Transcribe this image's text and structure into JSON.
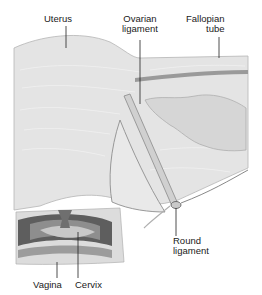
{
  "diagram": {
    "type": "anatomical-illustration",
    "colors": {
      "tissue_light": "#e4e4e4",
      "tissue_mid": "#d2d2d2",
      "tissue_dark": "#8c8c8c",
      "tissue_darkest": "#5a5a5a",
      "outline": "#9a9a9a",
      "leader_line": "#222222",
      "background": "#ffffff"
    },
    "labels": {
      "uterus": "Uterus",
      "ovarian_ligament_line1": "Ovarian",
      "ovarian_ligament_line2": "ligament",
      "fallopian_tube_line1": "Fallopian",
      "fallopian_tube_line2": "tube",
      "round_ligament_line1": "Round",
      "round_ligament_line2": "ligament",
      "vagina": "Vagina",
      "cervix": "Cervix"
    }
  }
}
